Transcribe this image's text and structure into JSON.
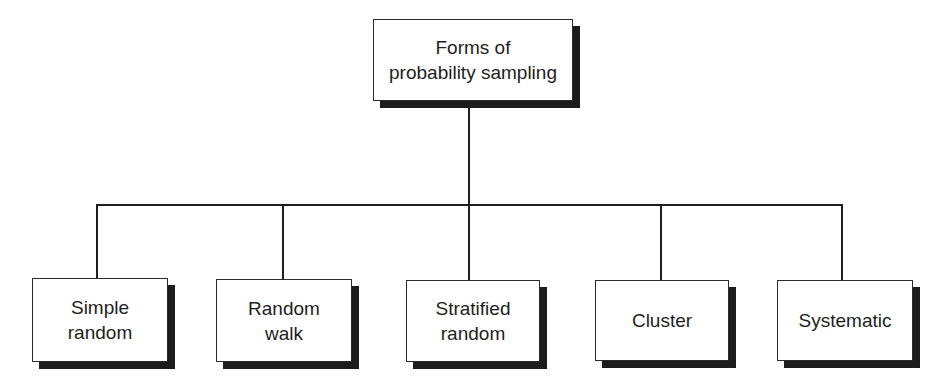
{
  "diagram": {
    "type": "tree",
    "root": {
      "label": "Forms of\nprobability sampling"
    },
    "children": [
      {
        "label": "Simple\nrandom"
      },
      {
        "label": "Random\nwalk"
      },
      {
        "label": "Stratified\nrandom"
      },
      {
        "label": "Cluster"
      },
      {
        "label": "Systematic"
      }
    ],
    "edges": [
      {
        "from": "Forms of probability sampling",
        "to": "Simple random"
      },
      {
        "from": "Forms of probability sampling",
        "to": "Random walk"
      },
      {
        "from": "Forms of probability sampling",
        "to": "Stratified random"
      },
      {
        "from": "Forms of probability sampling",
        "to": "Cluster"
      },
      {
        "from": "Forms of probability sampling",
        "to": "Systematic"
      }
    ]
  },
  "colors": {
    "background": "#ffffff",
    "ink": "#1f1f1f",
    "box_fill": "#ffffff",
    "shadow": "#1c1c1c"
  }
}
